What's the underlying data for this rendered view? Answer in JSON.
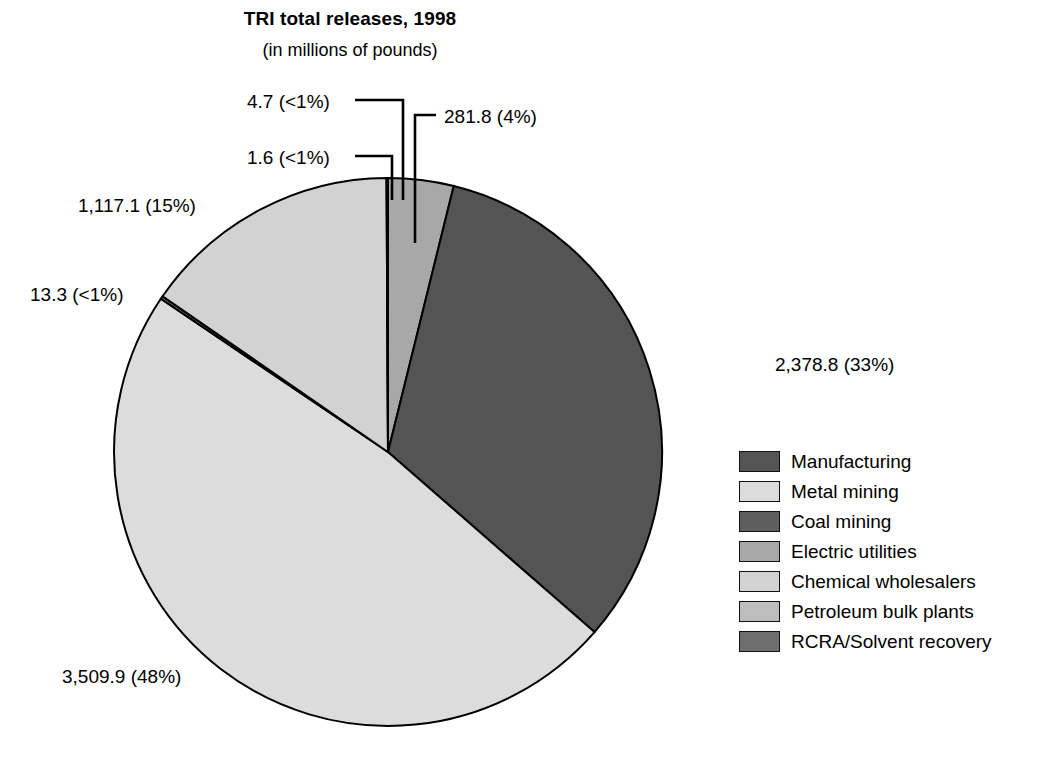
{
  "header": {
    "title": "TRI total releases, 1998",
    "subtitle": "(in millions of pounds)"
  },
  "legend": {
    "items": [
      {
        "label": "Manufacturing",
        "color": "#545454"
      },
      {
        "label": "Metal mining",
        "color": "#dcdcdc"
      },
      {
        "label": "Coal mining",
        "color": "#5e5e5e"
      },
      {
        "label": "Electric utilities",
        "color": "#a8a8a8"
      },
      {
        "label": "Chemical wholesalers",
        "color": "#d2d2d2"
      },
      {
        "label": "Petroleum bulk plants",
        "color": "#bdbdbd"
      },
      {
        "label": "RCRA/Solvent recovery",
        "color": "#6e6e6e"
      }
    ]
  },
  "labels": {
    "manufacturing": "2,378.8 (33%)",
    "metal_mining": "3,509.9 (48%)",
    "coal_mining": "13.3 (<1%)",
    "electric_utilities": "281.8 (4%)",
    "chemical_wholesalers": "1,117.1 (15%)",
    "petroleum_bulk_plants": "1.6 (<1%)",
    "rcra_solvent_recovery": "4.7 (<1%)"
  },
  "chart_data": {
    "type": "pie",
    "title": "TRI total releases, 1998",
    "subtitle": "(in millions of pounds)",
    "units": "millions of pounds",
    "total": 7307.2,
    "start_angle_deg": 0,
    "direction": "clockwise",
    "legend_position": "right",
    "categories": [
      "Manufacturing",
      "Metal mining",
      "Coal mining",
      "Electric utilities",
      "Chemical wholesalers",
      "Petroleum bulk plants",
      "RCRA/Solvent recovery"
    ],
    "values": [
      2378.8,
      3509.9,
      13.3,
      281.8,
      1117.1,
      1.6,
      4.7
    ],
    "percent_labels": [
      "33%",
      "48%",
      "<1%",
      "4%",
      "15%",
      "<1%",
      "<1%"
    ],
    "data_labels": [
      "2,378.8 (33%)",
      "3,509.9 (48%)",
      "13.3 (<1%)",
      "281.8 (4%)",
      "1,117.1 (15%)",
      "1.6 (<1%)",
      "4.7 (<1%)"
    ],
    "colors": [
      "#545454",
      "#dcdcdc",
      "#5e5e5e",
      "#a8a8a8",
      "#d2d2d2",
      "#bdbdbd",
      "#6e6e6e"
    ],
    "slice_order_clockwise_from_12": [
      "Electric utilities",
      "Manufacturing",
      "Metal mining",
      "Coal mining",
      "Chemical wholesalers",
      "Petroleum bulk plants",
      "RCRA/Solvent recovery"
    ]
  }
}
